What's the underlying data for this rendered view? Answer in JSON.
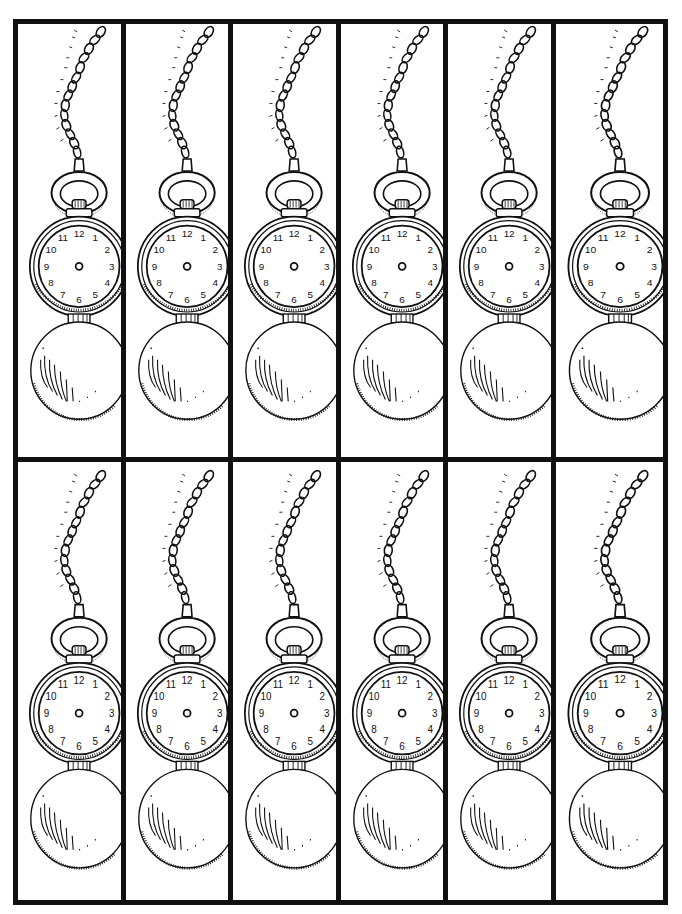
{
  "sheet": {
    "title": "",
    "layout": {
      "rows": 2,
      "columns": 6
    },
    "colors": {
      "ink": "#111111",
      "paper": "#ffffff"
    }
  },
  "bookmark": {
    "type": "pocket-watch-bookmark",
    "clock_numbers": [
      "12",
      "1",
      "2",
      "3",
      "4",
      "5",
      "6",
      "7",
      "8",
      "9",
      "10",
      "11"
    ],
    "has_hands": false
  },
  "cells": [
    {
      "row": 1,
      "col": 1,
      "top_offset": 0
    },
    {
      "row": 1,
      "col": 2,
      "top_offset": 0
    },
    {
      "row": 1,
      "col": 3,
      "top_offset": 0
    },
    {
      "row": 1,
      "col": 4,
      "top_offset": 0
    },
    {
      "row": 1,
      "col": 5,
      "top_offset": 0
    },
    {
      "row": 1,
      "col": 6,
      "top_offset": 0
    },
    {
      "row": 2,
      "col": 1,
      "top_offset": 0
    },
    {
      "row": 2,
      "col": 2,
      "top_offset": 0
    },
    {
      "row": 2,
      "col": 3,
      "top_offset": 0
    },
    {
      "row": 2,
      "col": 4,
      "top_offset": 0
    },
    {
      "row": 2,
      "col": 5,
      "top_offset": 0
    },
    {
      "row": 2,
      "col": 6,
      "top_offset": 0
    }
  ]
}
